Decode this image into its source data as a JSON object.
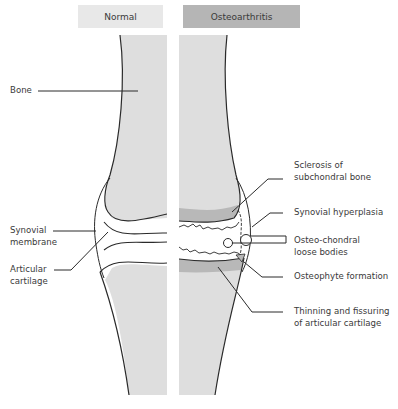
{
  "headers": {
    "normal": "Normal",
    "osteoarthritis": "Osteoarthritis"
  },
  "colors": {
    "bone_fill": "#dedede",
    "sclerosis_fill": "#b8b8b8",
    "normal_header": "#e8e8e8",
    "oa_header": "#b5b5b5",
    "line": "#2a2a2a"
  },
  "labels_left": {
    "bone": "Bone",
    "synovial_membrane_1": "Synovial",
    "synovial_membrane_2": "membrane",
    "articular_cartilage_1": "Articular",
    "articular_cartilage_2": "cartilage"
  },
  "labels_right": {
    "sclerosis_1": "Sclerosis of",
    "sclerosis_2": "subchondral bone",
    "synovial_hyperplasia": "Synovial hyperplasia",
    "loose_bodies_1": "Osteo-chondral",
    "loose_bodies_2": "loose bodies",
    "osteophyte": "Osteophyte formation",
    "thinning_1": "Thinning and fissuring",
    "thinning_2": "of articular cartilage"
  }
}
